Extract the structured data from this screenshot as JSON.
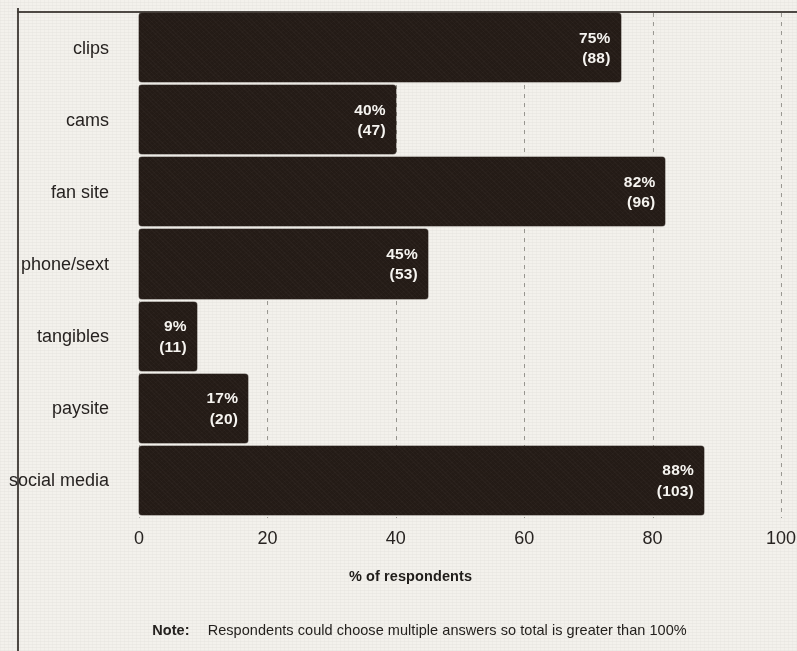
{
  "chart_data": {
    "type": "bar",
    "orientation": "horizontal",
    "title": "",
    "xlabel": "% of respondents",
    "ylabel": "",
    "xlim": [
      0,
      100
    ],
    "xticks": [
      "0",
      "20",
      "40",
      "60",
      "80",
      "100"
    ],
    "xtick_values": [
      0,
      20,
      40,
      60,
      80,
      100
    ],
    "grid": "vertical dotted gridlines",
    "legend": "none",
    "categories": [
      "clips",
      "cams",
      "fan site",
      "phone/sext",
      "tangibles",
      "paysite",
      "social media"
    ],
    "values": [
      75,
      40,
      82,
      45,
      9,
      17,
      88
    ],
    "counts": [
      88,
      47,
      96,
      53,
      11,
      20,
      103
    ],
    "bars": [
      {
        "category": "clips",
        "value": 75,
        "count": 88,
        "pct_label": "75%",
        "count_label": "(88)"
      },
      {
        "category": "cams",
        "value": 40,
        "count": 47,
        "pct_label": "40%",
        "count_label": "(47)"
      },
      {
        "category": "fan site",
        "value": 82,
        "count": 96,
        "pct_label": "82%",
        "count_label": "(96)"
      },
      {
        "category": "phone/sext",
        "value": 45,
        "count": 53,
        "pct_label": "45%",
        "count_label": "(53)"
      },
      {
        "category": "tangibles",
        "value": 9,
        "count": 11,
        "pct_label": "9%",
        "count_label": "(11)"
      },
      {
        "category": "paysite",
        "value": 17,
        "count": 20,
        "pct_label": "17%",
        "count_label": "(20)"
      },
      {
        "category": "social media",
        "value": 88,
        "count": 103,
        "pct_label": "88%",
        "count_label": "(103)"
      }
    ],
    "note": "Respondents could choose multiple answers so total is greater than 100%",
    "note_prefix": "Note:",
    "colors": {
      "bar": "#241b16",
      "bar_label_text": "#f6f4f0",
      "background": "#f3f1ec",
      "axis_text": "#272321",
      "gridline": "#8c8a84"
    }
  }
}
